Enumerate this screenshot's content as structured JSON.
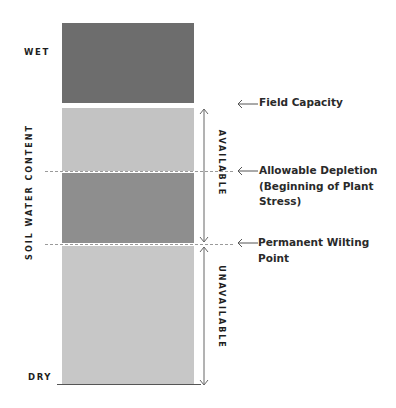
{
  "diagram": {
    "axis_label": "SOIL WATER CONTENT",
    "top_label": "WET",
    "bottom_label": "DRY",
    "bracket_labels": {
      "available": "AVAILABLE",
      "unavailable": "UNAVAILABLE"
    },
    "annotations": [
      {
        "id": "field-capacity",
        "lines": [
          "Field Capacity"
        ]
      },
      {
        "id": "allowable-depletion",
        "lines": [
          "Allowable Depletion",
          "(Beginning of Plant",
          "Stress)"
        ]
      },
      {
        "id": "permanent-wilting-point",
        "lines": [
          "Permanent Wilting Point"
        ]
      }
    ],
    "blocks": [
      {
        "id": "saturated",
        "color": "#6d6d6d"
      },
      {
        "id": "readily-available",
        "color": "#c3c3c3"
      },
      {
        "id": "stress-zone",
        "color": "#8e8e8e"
      },
      {
        "id": "unavailable",
        "color": "#c7c7c7"
      }
    ],
    "colors": {
      "line": "#555555",
      "dash": "#9a9a9a",
      "text": "#1e1e1e"
    }
  }
}
